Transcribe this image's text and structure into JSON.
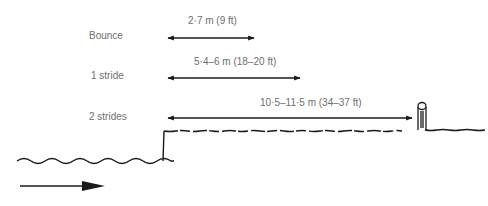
{
  "diagram": {
    "rows": [
      {
        "label": "Bounce",
        "distance": "2·7 m (9 ft)"
      },
      {
        "label": "1 stride",
        "distance": "5·4–6 m (18–20 ft)"
      },
      {
        "label": "2 strides",
        "distance": "10·5–11·5 m (34–37 ft)"
      }
    ],
    "elements": {
      "water": "wavy water line",
      "bank": "raised bank",
      "post": "fence post",
      "direction_arrow": "direction of travel"
    },
    "colors": {
      "ink": "#1a1a1a",
      "text": "#6e6e6e"
    }
  }
}
